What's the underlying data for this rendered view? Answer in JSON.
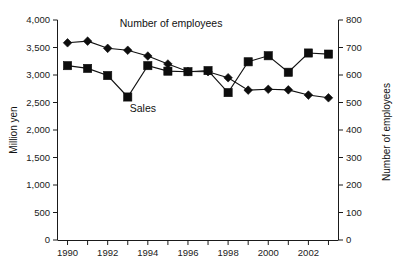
{
  "chart_data": {
    "type": "line",
    "title": "",
    "subtitle": "",
    "xlabel": "",
    "ylabel": "Million yen",
    "y2label": "Number of employees",
    "grid": false,
    "legend_position": "inline-annotations",
    "x": [
      1990,
      1991,
      1992,
      1993,
      1994,
      1995,
      1996,
      1997,
      1998,
      1999,
      2000,
      2001,
      2002,
      2003
    ],
    "categories": [
      "1990",
      "1991",
      "1992",
      "1993",
      "1994",
      "1995",
      "1996",
      "1997",
      "1998",
      "1999",
      "2000",
      "2001",
      "2002",
      "2003"
    ],
    "xtick_labels": [
      "1990",
      "",
      "1992",
      "",
      "1994",
      "",
      "1996",
      "",
      "1998",
      "",
      "2000",
      "",
      "2002",
      ""
    ],
    "ylim": [
      0,
      4000
    ],
    "ytick_labels": [
      "0",
      "500",
      "1,000",
      "1,500",
      "2,000",
      "2,500",
      "3,000",
      "3,500",
      "4,000"
    ],
    "ytick_values": [
      0,
      500,
      1000,
      1500,
      2000,
      2500,
      3000,
      3500,
      4000
    ],
    "y2lim": [
      0,
      800
    ],
    "y2tick_labels": [
      "0",
      "100",
      "200",
      "300",
      "400",
      "500",
      "600",
      "700",
      "800"
    ],
    "y2tick_values": [
      0,
      100,
      200,
      300,
      400,
      500,
      600,
      700,
      800
    ],
    "series": [
      {
        "name": "Sales",
        "axis": "left",
        "marker": "square",
        "color": "#0d0d0d",
        "annotation": "Sales",
        "values": [
          3170,
          3120,
          2990,
          2600,
          3170,
          3070,
          3060,
          3080,
          2680,
          3240,
          3350,
          3050,
          3400,
          3380
        ]
      },
      {
        "name": "Number of employees",
        "axis": "right",
        "marker": "diamond",
        "color": "#0d0d0d",
        "annotation": "Number of employees",
        "values": [
          717,
          723,
          697,
          690,
          669,
          640,
          613,
          612,
          590,
          545,
          548,
          546,
          527,
          517
        ]
      }
    ],
    "annotations": [
      {
        "text": "Number of employees",
        "x": 1992.6,
        "y_axis": "right",
        "y": 775
      },
      {
        "text": "Sales",
        "x": 1993.1,
        "y_axis": "left",
        "y": 2330
      }
    ]
  }
}
